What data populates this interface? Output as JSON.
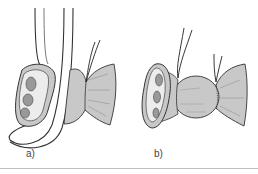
{
  "figure": {
    "panels": [
      {
        "label": "a)",
        "description": "Loop of tubular structure with cut cross-section beside a gathered, ligated stump"
      },
      {
        "label": "b)",
        "description": "Cut cross-section followed by two gathered, ligated segments"
      }
    ]
  },
  "colors": {
    "fill_gray": "#c8c8c8",
    "fill_light": "#e8e8e8",
    "line": "#333333",
    "divider": "#bdbdbd"
  }
}
